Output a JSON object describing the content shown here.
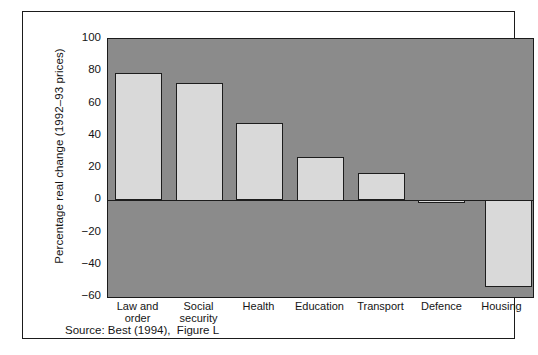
{
  "chart_data": {
    "type": "bar",
    "title": "",
    "xlabel": "",
    "ylabel": "Percentage real change (1992–93 prices)",
    "categories": [
      "Law and order",
      "Social security",
      "Health",
      "Education",
      "Transport",
      "Defence",
      "Housing"
    ],
    "category_lines": [
      [
        "Law and",
        "order"
      ],
      [
        "Social",
        "security"
      ],
      [
        "Health",
        ""
      ],
      [
        "Education",
        ""
      ],
      [
        "Transport",
        ""
      ],
      [
        "Defence",
        ""
      ],
      [
        "Housing",
        ""
      ]
    ],
    "values": [
      79,
      73,
      48,
      27,
      17,
      -1,
      -54
    ],
    "ylim": [
      -60,
      100
    ],
    "yticks": [
      100,
      80,
      60,
      40,
      20,
      0,
      -20,
      -40,
      -60
    ],
    "ytick_labels": [
      "100",
      "80",
      "60",
      "40",
      "20",
      "0",
      "−20",
      "−40",
      "−60"
    ],
    "grid": false,
    "legend": "none",
    "source": "Source: Best (1994),  Figure L",
    "colors": {
      "plot_background": "#8b8b8b",
      "bar_fill": "#d9d9d9",
      "bar_outline": "#1d1d1d",
      "axis": "#1b1b1b",
      "text": "#151515",
      "page_background": "#ffffff"
    }
  }
}
